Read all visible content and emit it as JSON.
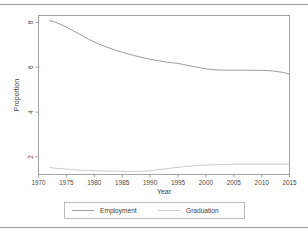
{
  "figure": {
    "background_color": "#ffffff",
    "border_color": "#9a9a9a",
    "frame_color": "#8d8d8d"
  },
  "chart_data": {
    "type": "line",
    "title": "",
    "xlabel": "Year",
    "ylabel": "Proportion",
    "xlim": [
      1970,
      2015
    ],
    "ylim": [
      1.35,
      8.45
    ],
    "grid": false,
    "legend_position": "bottom",
    "xticks": [
      1970,
      1975,
      1980,
      1985,
      1990,
      1995,
      2000,
      2005,
      2010,
      2015
    ],
    "xticklabels": [
      "1970",
      "1975",
      "1980",
      "1985",
      "1990",
      "1995",
      "2000",
      "2005",
      "2010",
      "2015"
    ],
    "yticks": [
      2,
      4,
      6,
      8
    ],
    "yticklabels": [
      "2",
      "4",
      "6",
      "8"
    ],
    "x": [
      1972,
      1973,
      1974,
      1975,
      1976,
      1977,
      1978,
      1979,
      1980,
      1981,
      1982,
      1983,
      1984,
      1985,
      1986,
      1987,
      1988,
      1989,
      1990,
      1991,
      1992,
      1993,
      1994,
      1995,
      1996,
      1997,
      1998,
      1999,
      2000,
      2001,
      2002,
      2003,
      2004,
      2005,
      2006,
      2007,
      2008,
      2009,
      2010,
      2011,
      2012,
      2013,
      2014,
      2015
    ],
    "series": [
      {
        "name": "Employment",
        "color": "#8a8a8a",
        "values": [
          8.22,
          8.15,
          8.05,
          7.94,
          7.8,
          7.66,
          7.52,
          7.39,
          7.27,
          7.16,
          7.06,
          6.97,
          6.89,
          6.81,
          6.74,
          6.67,
          6.61,
          6.55,
          6.5,
          6.45,
          6.41,
          6.37,
          6.34,
          6.31,
          6.26,
          6.21,
          6.16,
          6.11,
          6.07,
          6.04,
          6.02,
          6.01,
          6.01,
          6.01,
          6.01,
          6.01,
          6.0,
          6.0,
          6.0,
          5.99,
          5.97,
          5.94,
          5.9,
          5.84
        ]
      },
      {
        "name": "Graduation",
        "color": "#c2c2c2",
        "values": [
          1.66,
          1.63,
          1.61,
          1.59,
          1.57,
          1.55,
          1.54,
          1.53,
          1.52,
          1.51,
          1.51,
          1.5,
          1.5,
          1.49,
          1.49,
          1.49,
          1.49,
          1.5,
          1.52,
          1.55,
          1.58,
          1.61,
          1.64,
          1.67,
          1.7,
          1.72,
          1.74,
          1.76,
          1.77,
          1.78,
          1.79,
          1.8,
          1.8,
          1.81,
          1.81,
          1.81,
          1.81,
          1.81,
          1.81,
          1.81,
          1.81,
          1.81,
          1.81,
          1.81
        ]
      }
    ],
    "legend": [
      {
        "label": "Employment",
        "color": "#8a8a8a"
      },
      {
        "label": "Graduation",
        "color": "#c2c2c2"
      }
    ]
  }
}
